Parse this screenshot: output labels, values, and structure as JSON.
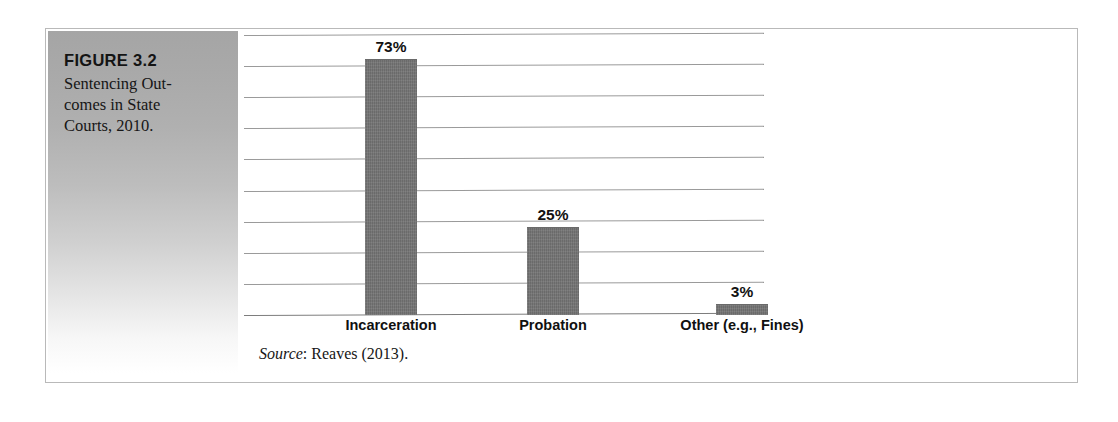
{
  "figure": {
    "number_label": "FIGURE 3.2",
    "caption": "Sentencing Out­comes in State Courts, 2010.",
    "source_word": "Source",
    "source_rest": ": Reaves (2013)."
  },
  "colors": {
    "bar_fill": "#757575",
    "gridline": "#9a9a9a",
    "frame_border": "#b9b9b9",
    "caption_band_top": "#a5a5a5",
    "caption_band_bottom": "#ffffff",
    "text": "#121212"
  },
  "chart_data": {
    "type": "bar",
    "categories": [
      "Incarceration",
      "Probation",
      "Other (e.g., Fines)"
    ],
    "values": [
      73,
      25,
      3
    ],
    "value_labels": [
      "73%",
      "25%",
      "3%"
    ],
    "xlabel": "",
    "ylabel": "",
    "ylim": [
      0,
      80
    ],
    "grid": true,
    "gridline_count": 10,
    "gridline_interval": 8,
    "legend": "none",
    "units": "percent",
    "source": "Reaves (2013)."
  }
}
